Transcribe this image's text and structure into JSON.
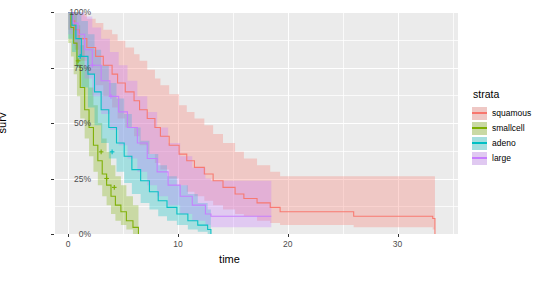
{
  "axes": {
    "x_title": "time",
    "y_title": "surv",
    "x_ticks": [
      "0",
      "10",
      "20",
      "30"
    ],
    "y_ticks": [
      "0%",
      "25%",
      "50%",
      "75%",
      "100%"
    ]
  },
  "legend": {
    "title": "strata",
    "items": [
      {
        "label": "squamous",
        "color": "#F8766D"
      },
      {
        "label": "smallcell",
        "color": "#7CAE00"
      },
      {
        "label": "adeno",
        "color": "#00BFC4"
      },
      {
        "label": "large",
        "color": "#C77CFF"
      }
    ]
  },
  "chart_data": {
    "type": "line",
    "title": "",
    "xlabel": "time",
    "ylabel": "surv",
    "xlim": [
      -1.2,
      35.5
    ],
    "ylim": [
      0,
      1
    ],
    "grid": true,
    "legend_position": "right",
    "legend_title": "strata",
    "censor_marker": "+",
    "panel_background": "#ebebeb",
    "gridline_color": "#ffffff",
    "series": [
      {
        "name": "squamous",
        "color": "#F8766D",
        "steps_x": [
          0,
          0.4,
          0.6,
          1.0,
          1.7,
          2.5,
          3.2,
          4.0,
          4.5,
          5.2,
          6.0,
          6.5,
          7.2,
          7.9,
          8.4,
          9.2,
          10.1,
          10.8,
          11.5,
          12.4,
          13.2,
          14.1,
          15.2,
          16.0,
          17.2,
          18.4,
          19.3,
          26.0,
          33.2,
          33.4
        ],
        "steps_y": [
          1.0,
          0.96,
          0.92,
          0.88,
          0.84,
          0.8,
          0.76,
          0.72,
          0.68,
          0.64,
          0.6,
          0.56,
          0.52,
          0.48,
          0.44,
          0.4,
          0.36,
          0.33,
          0.3,
          0.27,
          0.24,
          0.21,
          0.18,
          0.16,
          0.14,
          0.12,
          0.1,
          0.08,
          0.07,
          0.0
        ],
        "ci_lower": [
          0.92,
          0.88,
          0.83,
          0.78,
          0.72,
          0.67,
          0.62,
          0.57,
          0.52,
          0.48,
          0.44,
          0.4,
          0.36,
          0.32,
          0.29,
          0.25,
          0.22,
          0.19,
          0.17,
          0.15,
          0.13,
          0.11,
          0.09,
          0.08,
          0.06,
          0.05,
          0.04,
          0.03,
          0.02,
          0.0
        ],
        "ci_upper": [
          1.0,
          1.0,
          1.0,
          0.99,
          0.97,
          0.95,
          0.92,
          0.9,
          0.87,
          0.84,
          0.81,
          0.78,
          0.74,
          0.7,
          0.67,
          0.63,
          0.58,
          0.55,
          0.52,
          0.49,
          0.45,
          0.41,
          0.37,
          0.34,
          0.31,
          0.28,
          0.26,
          0.26,
          0.26,
          0.26
        ],
        "censored_x": [],
        "censored_y": []
      },
      {
        "name": "smallcell",
        "color": "#7CAE00",
        "steps_x": [
          0,
          0.25,
          0.5,
          0.8,
          1.1,
          1.5,
          1.9,
          2.3,
          2.7,
          3.1,
          3.5,
          3.9,
          4.3,
          4.8,
          5.3,
          5.9,
          6.4
        ],
        "steps_y": [
          1.0,
          0.93,
          0.86,
          0.76,
          0.66,
          0.56,
          0.48,
          0.4,
          0.33,
          0.27,
          0.22,
          0.17,
          0.13,
          0.1,
          0.06,
          0.03,
          0.0
        ],
        "ci_lower": [
          0.86,
          0.8,
          0.72,
          0.62,
          0.52,
          0.43,
          0.35,
          0.28,
          0.22,
          0.17,
          0.13,
          0.09,
          0.06,
          0.04,
          0.02,
          0.0,
          0.0
        ],
        "ci_upper": [
          1.0,
          1.0,
          1.0,
          0.94,
          0.85,
          0.75,
          0.66,
          0.58,
          0.5,
          0.43,
          0.37,
          0.31,
          0.26,
          0.22,
          0.17,
          0.13,
          0.1
        ],
        "censored_x": [
          0.9,
          3.0,
          3.5,
          4.2
        ],
        "censored_y": [
          0.78,
          0.37,
          0.25,
          0.21
        ]
      },
      {
        "name": "adeno",
        "color": "#00BFC4",
        "steps_x": [
          0,
          0.35,
          0.7,
          1.2,
          1.8,
          2.4,
          3.0,
          3.7,
          4.4,
          5.1,
          5.8,
          6.6,
          7.4,
          8.2,
          9.0,
          9.9,
          10.9,
          11.8,
          12.7,
          13.0
        ],
        "steps_y": [
          1.0,
          0.94,
          0.88,
          0.8,
          0.72,
          0.64,
          0.56,
          0.48,
          0.41,
          0.35,
          0.29,
          0.24,
          0.19,
          0.15,
          0.12,
          0.09,
          0.06,
          0.04,
          0.02,
          0.0
        ],
        "ci_lower": [
          0.88,
          0.82,
          0.75,
          0.66,
          0.57,
          0.49,
          0.41,
          0.34,
          0.28,
          0.23,
          0.18,
          0.14,
          0.11,
          0.08,
          0.06,
          0.04,
          0.02,
          0.01,
          0.0,
          0.0
        ],
        "ci_upper": [
          1.0,
          1.0,
          1.0,
          0.96,
          0.9,
          0.83,
          0.76,
          0.68,
          0.61,
          0.54,
          0.48,
          0.42,
          0.36,
          0.31,
          0.26,
          0.22,
          0.18,
          0.14,
          0.11,
          0.08
        ],
        "censored_x": [
          1.1,
          4.0
        ],
        "censored_y": [
          0.8,
          0.37
        ]
      },
      {
        "name": "large",
        "color": "#C77CFF",
        "steps_x": [
          0,
          0.45,
          0.9,
          1.5,
          2.2,
          3.0,
          3.8,
          4.6,
          5.4,
          6.3,
          7.2,
          8.1,
          9.1,
          10.2,
          11.3,
          12.5,
          13.0,
          18.5
        ],
        "steps_y": [
          1.0,
          0.95,
          0.9,
          0.83,
          0.76,
          0.69,
          0.62,
          0.55,
          0.48,
          0.41,
          0.34,
          0.28,
          0.22,
          0.17,
          0.13,
          0.09,
          0.08,
          0.08
        ],
        "ci_lower": [
          0.9,
          0.85,
          0.79,
          0.7,
          0.62,
          0.54,
          0.47,
          0.4,
          0.34,
          0.28,
          0.22,
          0.17,
          0.13,
          0.09,
          0.06,
          0.04,
          0.03,
          0.03
        ],
        "ci_upper": [
          1.0,
          1.0,
          1.0,
          0.98,
          0.93,
          0.88,
          0.82,
          0.76,
          0.69,
          0.62,
          0.55,
          0.48,
          0.41,
          0.35,
          0.3,
          0.25,
          0.24,
          0.24
        ],
        "censored_x": [
          2.2,
          3.9
        ],
        "censored_y": [
          0.76,
          0.62
        ]
      }
    ]
  }
}
